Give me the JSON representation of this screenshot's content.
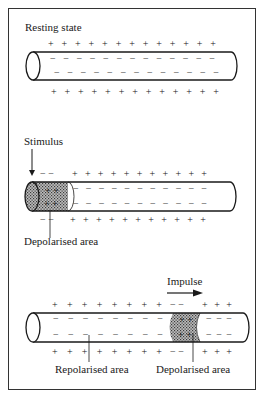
{
  "panels": [
    {
      "id": "resting",
      "title": "Resting state",
      "outside_top": "+ + + + + + + + + + + + +",
      "inside_top": "− − − − − − − − − − − − −",
      "inside_bottom": "− − − − − − − − − − − − −",
      "outside_bottom": "+ + + + + + + + + + + + +"
    },
    {
      "id": "stimulus",
      "title": "Stimulus",
      "depol_outside_top": "− −",
      "depol_inside_top": "+ +",
      "depol_inside_bottom": "+ +",
      "depol_outside_bottom": "− −",
      "outside_top": "+ + + + + + + + + + +",
      "inside_top": "− − − − − − − − − − −",
      "inside_bottom": "− − − − − − − − − − −",
      "outside_bottom": "+ + + + + + + + + + +",
      "callout": "Depolarised area"
    },
    {
      "id": "impulse",
      "title": "Impulse",
      "left_outside_top": "+ + + + + + + +",
      "left_inside_top": "− − − − − − − −",
      "left_inside_bottom": "− − − − − − − −",
      "left_outside_bottom": "+ + + + + + + +",
      "depol_outside_top": "− −",
      "depol_inside_top": "+ +",
      "depol_inside_bottom": "+ +",
      "depol_outside_bottom": "− −",
      "right_outside_top": "+ + +",
      "right_inside_top": "− − −",
      "right_inside_bottom": "− − −",
      "right_outside_bottom": "+ + +",
      "callout_left": "Repolarised area",
      "callout_right": "Depolarised area"
    }
  ],
  "colors": {
    "ink": "#1a1a1a",
    "depolarised_fill": "#9a9a9a",
    "background": "#ffffff"
  }
}
